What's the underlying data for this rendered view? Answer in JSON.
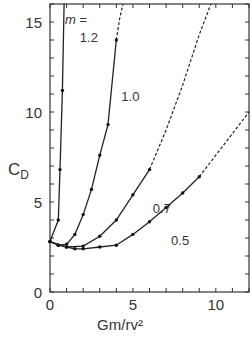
{
  "chart_data": {
    "type": "line",
    "title": "",
    "xlabel": "Gm/rv²",
    "ylabel": "C_D",
    "xlim": [
      0,
      12
    ],
    "ylim": [
      0,
      16
    ],
    "xticks": [
      0,
      5,
      10
    ],
    "yticks": [
      0,
      5,
      10,
      15
    ],
    "grid": false,
    "legend_title": "m =",
    "series": [
      {
        "name": "1.2",
        "label_pos": [
          1.8,
          13.9
        ],
        "solid": [
          [
            0.0,
            2.8
          ],
          [
            0.5,
            4.0
          ],
          [
            0.6,
            6.8
          ],
          [
            0.75,
            11.2
          ],
          [
            0.85,
            16.0
          ]
        ],
        "points": [
          [
            0.0,
            2.8
          ],
          [
            0.5,
            4.0
          ],
          [
            0.6,
            6.8
          ],
          [
            0.75,
            11.2
          ]
        ],
        "dashed": []
      },
      {
        "name": "1.0",
        "label_pos": [
          4.3,
          10.6
        ],
        "solid": [
          [
            0.0,
            2.8
          ],
          [
            0.5,
            2.6
          ],
          [
            1.0,
            2.65
          ],
          [
            1.5,
            3.2
          ],
          [
            2.0,
            4.3
          ],
          [
            2.5,
            5.7
          ],
          [
            3.0,
            7.6
          ],
          [
            3.5,
            9.3
          ],
          [
            4.0,
            14.0
          ]
        ],
        "points": [
          [
            0.0,
            2.8
          ],
          [
            0.5,
            2.6
          ],
          [
            1.0,
            2.65
          ],
          [
            1.5,
            3.2
          ],
          [
            2.0,
            4.3
          ],
          [
            2.5,
            5.7
          ],
          [
            3.0,
            7.6
          ],
          [
            3.5,
            9.3
          ],
          [
            4.0,
            14.0
          ]
        ],
        "dashed": [
          [
            4.0,
            14.0
          ],
          [
            4.2,
            15.2
          ],
          [
            4.4,
            16.0
          ]
        ]
      },
      {
        "name": "0.7",
        "label_pos": [
          6.2,
          4.4
        ],
        "solid": [
          [
            0.0,
            2.8
          ],
          [
            0.5,
            2.6
          ],
          [
            1.0,
            2.5
          ],
          [
            2.0,
            2.55
          ],
          [
            3.0,
            3.1
          ],
          [
            4.0,
            4.0
          ],
          [
            5.0,
            5.4
          ],
          [
            6.0,
            6.8
          ]
        ],
        "points": [
          [
            0.0,
            2.8
          ],
          [
            0.5,
            2.6
          ],
          [
            1.0,
            2.5
          ],
          [
            2.0,
            2.55
          ],
          [
            3.0,
            3.1
          ],
          [
            4.0,
            4.0
          ],
          [
            5.0,
            5.4
          ],
          [
            6.0,
            6.8
          ]
        ],
        "dashed": [
          [
            6.0,
            6.8
          ],
          [
            7.0,
            9.0
          ],
          [
            8.0,
            11.5
          ],
          [
            9.0,
            14.3
          ],
          [
            9.7,
            16.0
          ]
        ]
      },
      {
        "name": "0.5",
        "label_pos": [
          7.3,
          2.6
        ],
        "solid": [
          [
            0.0,
            2.8
          ],
          [
            1.0,
            2.5
          ],
          [
            1.5,
            2.4
          ],
          [
            2.0,
            2.4
          ],
          [
            3.0,
            2.5
          ],
          [
            4.0,
            2.6
          ],
          [
            5.0,
            3.2
          ],
          [
            6.0,
            3.9
          ],
          [
            7.0,
            4.7
          ],
          [
            8.0,
            5.5
          ],
          [
            9.0,
            6.4
          ]
        ],
        "points": [
          [
            0.0,
            2.8
          ],
          [
            1.0,
            2.5
          ],
          [
            1.5,
            2.4
          ],
          [
            2.0,
            2.4
          ],
          [
            3.0,
            2.5
          ],
          [
            4.0,
            2.6
          ],
          [
            5.0,
            3.2
          ],
          [
            6.0,
            3.9
          ],
          [
            7.0,
            4.7
          ],
          [
            8.0,
            5.5
          ],
          [
            9.0,
            6.4
          ]
        ],
        "dashed": [
          [
            9.0,
            6.4
          ],
          [
            10.0,
            7.6
          ],
          [
            11.0,
            8.8
          ],
          [
            12.0,
            10.0
          ]
        ]
      }
    ]
  },
  "labels": {
    "y_axis": "C",
    "y_axis_sub": "D",
    "x_axis": "Gm/rv²",
    "legend_title": "m ="
  }
}
